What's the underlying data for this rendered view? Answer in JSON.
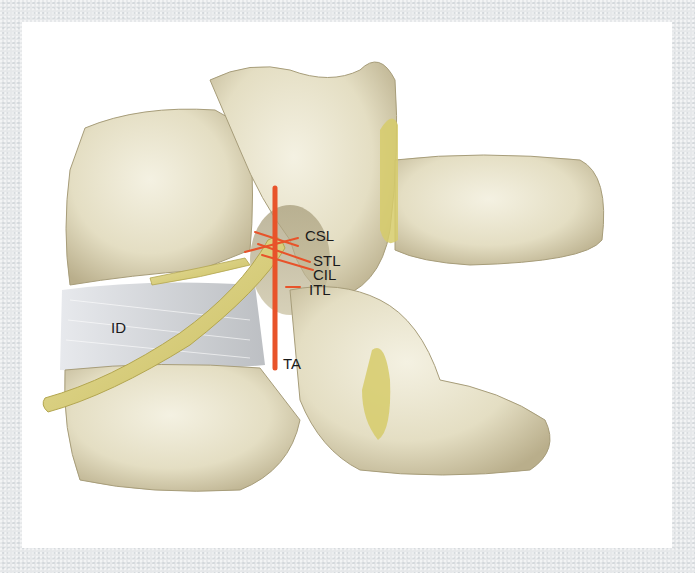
{
  "figure": {
    "labels": {
      "csl": "CSL",
      "stl": "STL",
      "cil": "CIL",
      "itl": "ITL",
      "id": "ID",
      "ta": "TA"
    },
    "colors": {
      "frame": "#e6e8ea",
      "panel": "#ffffff",
      "bone": "#e9e4cc",
      "bone_shadow": "#b8ae8c",
      "nerve": "#d9cf7a",
      "ligament_lines": "#e8532a",
      "disc": "#d8dade",
      "label_text": "#1a1a1a"
    }
  }
}
